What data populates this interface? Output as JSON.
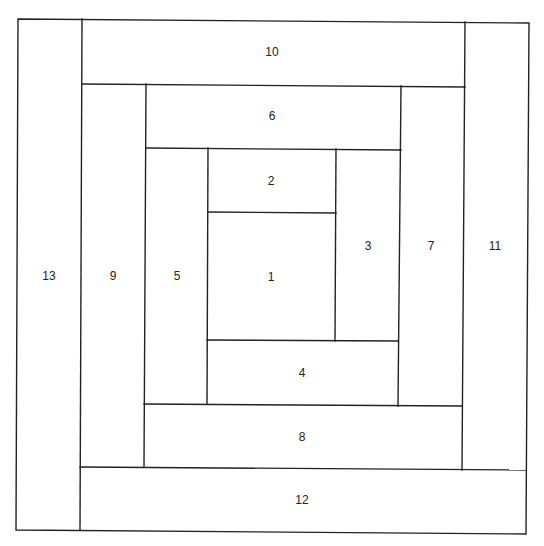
{
  "diagram": {
    "title": "",
    "type": "log-cabin block layout",
    "colors": {
      "line": "#222222",
      "background": "#ffffff",
      "text": "#222222"
    },
    "outline": [
      [
        18,
        19
      ],
      [
        529,
        23
      ],
      [
        526,
        534
      ],
      [
        16,
        530
      ]
    ],
    "lines": [
      {
        "id": "13-right",
        "from": [
          82,
          19
        ],
        "to": [
          80,
          530
        ]
      },
      {
        "id": "10-bottom",
        "from": [
          82,
          84
        ],
        "to": [
          465,
          87
        ]
      },
      {
        "id": "11-left",
        "from": [
          465,
          22
        ],
        "to": [
          462,
          470
        ]
      },
      {
        "id": "9-right",
        "from": [
          146,
          84
        ],
        "to": [
          144,
          467
        ]
      },
      {
        "id": "6-bottom",
        "from": [
          146,
          148
        ],
        "to": [
          401,
          150
        ]
      },
      {
        "id": "7-left",
        "from": [
          401,
          86
        ],
        "to": [
          398,
          406
        ]
      },
      {
        "id": "5-right",
        "from": [
          208,
          148
        ],
        "to": [
          207,
          404
        ]
      },
      {
        "id": "2-bottom",
        "from": [
          208,
          212
        ],
        "to": [
          336,
          213
        ]
      },
      {
        "id": "3-left",
        "from": [
          336,
          149
        ],
        "to": [
          335,
          341
        ]
      },
      {
        "id": "4-top",
        "from": [
          207,
          340
        ],
        "to": [
          398,
          341
        ]
      },
      {
        "id": "8-top",
        "from": [
          144,
          404
        ],
        "to": [
          462,
          406
        ]
      },
      {
        "id": "12-top",
        "from": [
          80,
          467
        ],
        "to": [
          526,
          470
        ]
      }
    ],
    "blocks": [
      {
        "label": "1",
        "x": 271,
        "y": 277
      },
      {
        "label": "2",
        "x": 271,
        "y": 181
      },
      {
        "label": "3",
        "x": 368,
        "y": 246
      },
      {
        "label": "4",
        "x": 302,
        "y": 373
      },
      {
        "label": "5",
        "x": 177,
        "y": 276
      },
      {
        "label": "6",
        "x": 272,
        "y": 116
      },
      {
        "label": "7",
        "x": 431,
        "y": 246
      },
      {
        "label": "8",
        "x": 302,
        "y": 437
      },
      {
        "label": "9",
        "x": 113,
        "y": 276
      },
      {
        "label": "10",
        "x": 272,
        "y": 52
      },
      {
        "label": "11",
        "x": 495,
        "y": 246
      },
      {
        "label": "12",
        "x": 302,
        "y": 500
      },
      {
        "label": "13",
        "x": 49,
        "y": 276
      }
    ]
  }
}
